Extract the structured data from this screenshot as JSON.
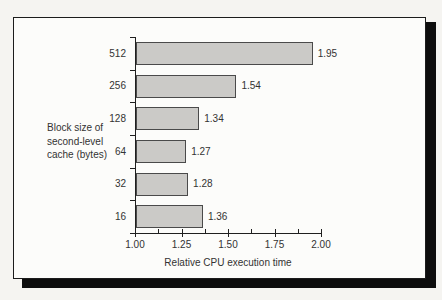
{
  "figure": {
    "ylabel_lines": [
      "Block size of",
      "second-level",
      "cache (bytes)"
    ],
    "colors": {
      "page_bg": "#f5f4f1",
      "box_bg": "#fcfcfa",
      "box_border": "#1c1c1c",
      "shadow": "#0d0d0d",
      "bar_fill": "#cbcac7",
      "bar_border": "#4a4a4a",
      "axis": "#1f1f1f",
      "text": "#333333"
    }
  },
  "chart_data": {
    "type": "bar",
    "orientation": "horizontal",
    "title": "",
    "categories": [
      "512",
      "256",
      "128",
      "64",
      "32",
      "16"
    ],
    "values": [
      1.95,
      1.54,
      1.34,
      1.27,
      1.28,
      1.36
    ],
    "value_labels": [
      "1.95",
      "1.54",
      "1.34",
      "1.27",
      "1.28",
      "1.36"
    ],
    "xlabel": "Relative CPU execution time",
    "ylabel": "Block size of second-level cache (bytes)",
    "xlim": [
      1.0,
      2.0
    ],
    "x_ticks": [
      1.0,
      1.25,
      1.5,
      1.75,
      2.0
    ],
    "x_tick_labels": [
      "1.00",
      "1.25",
      "1.50",
      "1.75",
      "2.00"
    ],
    "x_minor_ticks": [
      1.125,
      1.375,
      1.625,
      1.875
    ],
    "grid": false,
    "legend": "none"
  }
}
